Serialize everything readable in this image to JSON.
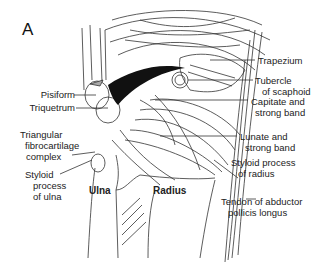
{
  "figure": {
    "panel_label": "A",
    "colors": {
      "line": "#333333",
      "dark_fill": "#111111",
      "background": "#ffffff"
    },
    "labels_left": [
      {
        "id": "pisiform",
        "text": "Pisiform"
      },
      {
        "id": "triquetrum",
        "text": "Triquetrum"
      },
      {
        "id": "tfcc_1",
        "text": "Triangular"
      },
      {
        "id": "tfcc_2",
        "text": "fibrocartilage"
      },
      {
        "id": "tfcc_3",
        "text": "complex"
      },
      {
        "id": "styloid_ulna_1",
        "text": "Styloid"
      },
      {
        "id": "styloid_ulna_2",
        "text": "process"
      },
      {
        "id": "styloid_ulna_3",
        "text": "of ulna"
      }
    ],
    "labels_right": [
      {
        "id": "trapezium",
        "text": "Trapezium"
      },
      {
        "id": "tubercle_1",
        "text": "Tubercle"
      },
      {
        "id": "tubercle_2",
        "text": "of scaphoid"
      },
      {
        "id": "capitate_1",
        "text": "Capitate and"
      },
      {
        "id": "capitate_2",
        "text": "strong band"
      },
      {
        "id": "lunate_1",
        "text": "Lunate and"
      },
      {
        "id": "lunate_2",
        "text": "strong band"
      },
      {
        "id": "styloid_radius_1",
        "text": "Styloid process"
      },
      {
        "id": "styloid_radius_2",
        "text": "of radius"
      },
      {
        "id": "tendon_1",
        "text": "Tendon of abductor"
      },
      {
        "id": "tendon_2",
        "text": "pollicis longus"
      }
    ],
    "bone_labels": {
      "ulna": "Ulna",
      "radius": "Radius"
    }
  }
}
